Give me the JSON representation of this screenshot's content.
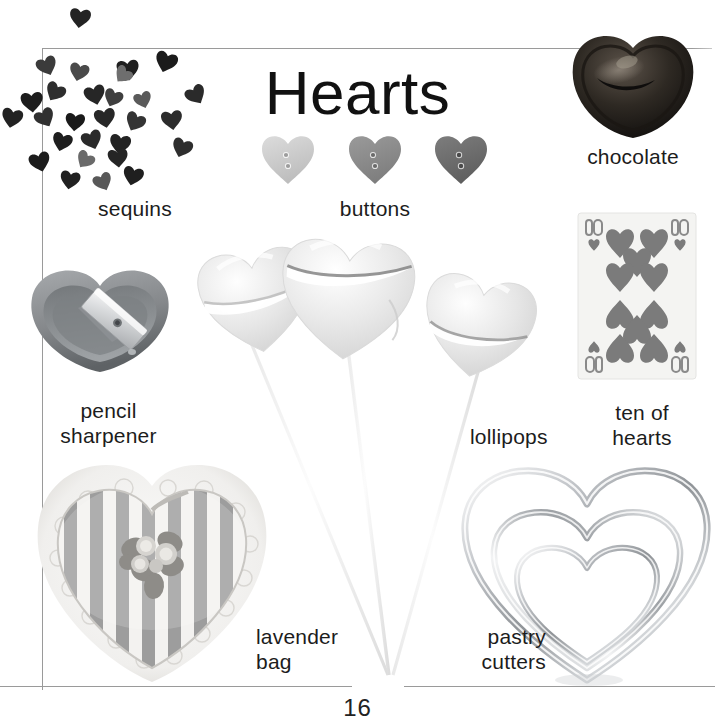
{
  "page": {
    "title": "Hearts",
    "number": "16",
    "background": "#ffffff",
    "rule_color": "#9a9a9a"
  },
  "items": [
    {
      "id": "sequins",
      "icon": "heart-sequins-icon",
      "caption": "sequins",
      "caption_align": "center",
      "colors": [
        "#2b2b2b",
        "#3a3a3a",
        "#4e4e4e",
        "#6b6b6b"
      ]
    },
    {
      "id": "buttons",
      "icon": "heart-buttons-icon",
      "caption": "buttons",
      "caption_align": "center",
      "button_colors": [
        "#c9c9c9",
        "#8d8d8d",
        "#6e6e6e"
      ],
      "hole_count": 2
    },
    {
      "id": "chocolate",
      "icon": "chocolate-heart-icon",
      "caption": "chocolate",
      "caption_align": "center",
      "colors": [
        "#2a2622",
        "#0e0c0b",
        "#5a524a"
      ]
    },
    {
      "id": "pencil-sharpener",
      "icon": "heart-pencil-sharpener-icon",
      "caption": "pencil\nsharpener",
      "caption_align": "center",
      "colors": [
        "#8e9093",
        "#6f7376",
        "#d8dadc"
      ]
    },
    {
      "id": "ten-of-hearts",
      "icon": "playing-card-icon",
      "caption": "ten of\nhearts",
      "caption_align": "center",
      "card_rank": "10",
      "card_suit": "hearts",
      "pip_count": 10,
      "pip_color": "#7b7b7b",
      "card_face": "#f4f4f2"
    },
    {
      "id": "lollipops",
      "icon": "heart-lollipop-icon",
      "caption": "lollipops",
      "caption_align": "left",
      "count": 3,
      "colors": [
        "#ececec",
        "#dcdcdc",
        "#ffffff"
      ]
    },
    {
      "id": "lavender-bag",
      "icon": "lavender-bag-icon",
      "caption": "lavender\nbag",
      "caption_align": "left",
      "colors": [
        "#9a9a9a",
        "#f2f2f0",
        "#cfcfcf"
      ]
    },
    {
      "id": "pastry-cutters",
      "icon": "heart-pastry-cutters-icon",
      "caption": "pastry\ncutters",
      "caption_align": "right",
      "count": 3,
      "colors": [
        "#b9bcc0",
        "#8d9195",
        "#e8eaec"
      ]
    }
  ]
}
